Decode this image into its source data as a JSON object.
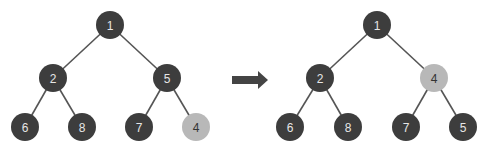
{
  "colors": {
    "dark_node": "#3d3d3d",
    "highlight_node": "#b8b8b8",
    "edge": "#555555",
    "arrow": "#444444"
  },
  "before": {
    "nodes": [
      {
        "id": "b1",
        "label": "1",
        "x": 110,
        "y": 25,
        "highlight": false
      },
      {
        "id": "b2",
        "label": "2",
        "x": 53,
        "y": 78,
        "highlight": false
      },
      {
        "id": "b5",
        "label": "5",
        "x": 167,
        "y": 78,
        "highlight": false
      },
      {
        "id": "b6",
        "label": "6",
        "x": 25,
        "y": 127,
        "highlight": false
      },
      {
        "id": "b8",
        "label": "8",
        "x": 82,
        "y": 127,
        "highlight": false
      },
      {
        "id": "b7",
        "label": "7",
        "x": 139,
        "y": 127,
        "highlight": false
      },
      {
        "id": "b4",
        "label": "4",
        "x": 196,
        "y": 127,
        "highlight": true
      }
    ],
    "edges": [
      [
        "b1",
        "b2"
      ],
      [
        "b1",
        "b5"
      ],
      [
        "b2",
        "b6"
      ],
      [
        "b2",
        "b8"
      ],
      [
        "b5",
        "b7"
      ],
      [
        "b5",
        "b4"
      ]
    ]
  },
  "after": {
    "nodes": [
      {
        "id": "a1",
        "label": "1",
        "x": 377,
        "y": 25,
        "highlight": false
      },
      {
        "id": "a2",
        "label": "2",
        "x": 320,
        "y": 78,
        "highlight": false
      },
      {
        "id": "a4",
        "label": "4",
        "x": 434,
        "y": 78,
        "highlight": true
      },
      {
        "id": "a6",
        "label": "6",
        "x": 290,
        "y": 127,
        "highlight": false
      },
      {
        "id": "a8",
        "label": "8",
        "x": 348,
        "y": 127,
        "highlight": false
      },
      {
        "id": "a7",
        "label": "7",
        "x": 406,
        "y": 127,
        "highlight": false
      },
      {
        "id": "a5",
        "label": "5",
        "x": 463,
        "y": 127,
        "highlight": false
      }
    ],
    "edges": [
      [
        "a1",
        "a2"
      ],
      [
        "a1",
        "a4"
      ],
      [
        "a2",
        "a6"
      ],
      [
        "a2",
        "a8"
      ],
      [
        "a4",
        "a7"
      ],
      [
        "a4",
        "a5"
      ]
    ]
  },
  "arrow": {
    "x1": 232,
    "x2": 268,
    "y": 80,
    "direction": "right"
  },
  "node_radius": 14
}
